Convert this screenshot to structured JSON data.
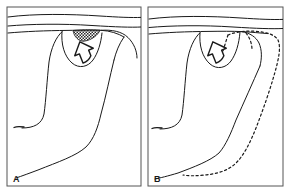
{
  "figure": {
    "kind": "line-drawing-figure",
    "background_color": "#ffffff",
    "line_color": "#1a1a1a",
    "frame_color": "#555555",
    "hatch_color": "#2a2a2a",
    "panel_count": 2
  },
  "panels": [
    {
      "id": "A",
      "label": "A",
      "label_position": "bottom-left",
      "features": {
        "surface_lines": 2,
        "hatched_region": "crosshatched lens-shaped lesion at surface",
        "arrow": "open outline arrow pointing up-right toward hatched region",
        "dashed_outline": "none"
      }
    },
    {
      "id": "B",
      "label": "B",
      "label_position": "bottom-left",
      "features": {
        "surface_lines": 2,
        "hatched_region": "none",
        "arrow": "open outline arrow pointing up-right",
        "dashed_outline": "large elongated dashed loop along right side indicating planned or resected extent"
      }
    }
  ]
}
